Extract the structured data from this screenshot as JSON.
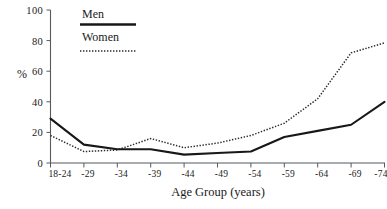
{
  "chart_data": {
    "type": "line",
    "title": "",
    "xlabel": "Age Group (years)",
    "ylabel": "%",
    "categories": [
      "18-24",
      "-29",
      "-34",
      "-39",
      "-44",
      "-49",
      "-54",
      "-59",
      "-64",
      "-69",
      "-74"
    ],
    "series": [
      {
        "name": "Men",
        "style": "solid",
        "color": "#17181a",
        "values": [
          29,
          12,
          9,
          9,
          5.5,
          6.5,
          7.5,
          17,
          21,
          25,
          40
        ]
      },
      {
        "name": "Women",
        "style": "dotted",
        "color": "#2a2b2e",
        "values": [
          18,
          7.5,
          8.5,
          16,
          10,
          13,
          18,
          26,
          42,
          72,
          78.5
        ]
      }
    ],
    "ylim": [
      0,
      100
    ],
    "yticks": [
      0,
      20,
      40,
      60,
      80,
      100
    ],
    "ytick_labels": [
      "0",
      "20",
      "40",
      "60",
      "80",
      "100"
    ],
    "grid": false,
    "legend_position": "top-left-inside"
  },
  "legend": {
    "entries": [
      {
        "label": "Men",
        "style": "solid"
      },
      {
        "label": "Women",
        "style": "dotted"
      }
    ]
  },
  "axes": {
    "y_title": "%",
    "x_title": "Age Group (years)"
  }
}
